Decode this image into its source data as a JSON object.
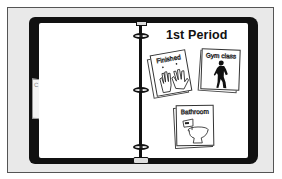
{
  "binder": {
    "title": "1st Period",
    "left_tab_letter": "C",
    "cards": [
      {
        "label": "Finished",
        "icon": "hands-icon"
      },
      {
        "label": "Gym class",
        "icon": "person-exercising-icon"
      },
      {
        "label": "Bathroom",
        "icon": "toilet-icon"
      }
    ]
  },
  "colors": {
    "frame_bg": "#e9e9e9",
    "binder": "#111111",
    "page": "#ffffff"
  }
}
